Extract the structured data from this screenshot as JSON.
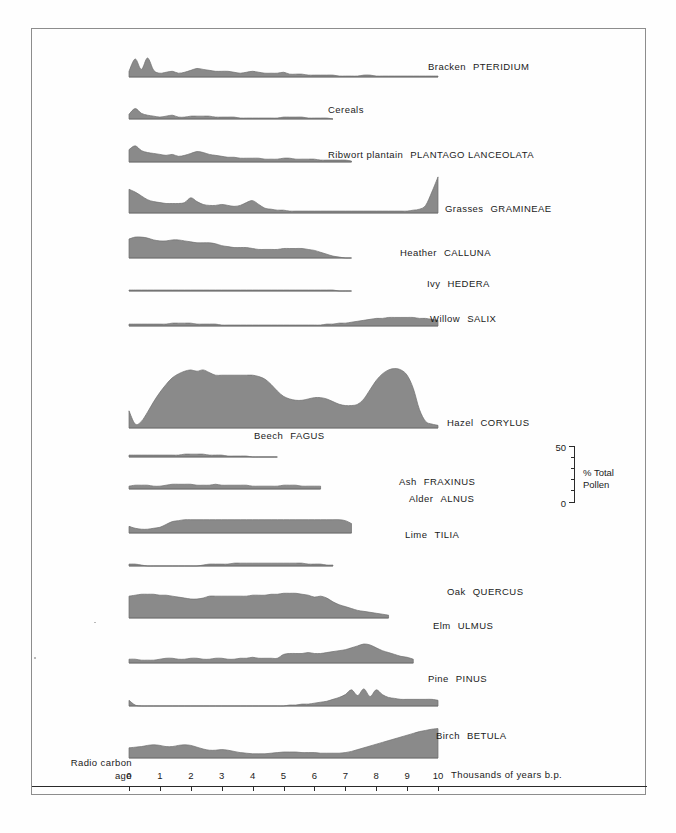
{
  "figure": {
    "type": "pollen-percentage-diagram",
    "fill_color": "#8a8a8a",
    "line_color": "#6f6f6f",
    "axis_color": "#2a2a2a"
  },
  "axis": {
    "left_label_line1": "Radio  carbon",
    "left_label_line2": "age",
    "right_label": "Thousands of years    b.p.",
    "ticks": [
      "0",
      "1",
      "2",
      "3",
      "4",
      "5",
      "6",
      "7",
      "8",
      "9",
      "10"
    ],
    "x_min": 0,
    "x_max": 10
  },
  "scale": {
    "top_value": "50",
    "bottom_value": "0",
    "unit_line1": "% Total",
    "unit_line2": "Pollen",
    "units": "% Total Pollen",
    "range": [
      0,
      50
    ]
  },
  "chart_data": {
    "type": "area",
    "title": "",
    "xlabel": "Thousands of years b.p. (radio carbon age)",
    "ylabel": "% Total Pollen",
    "xlim": [
      0,
      10
    ],
    "ylim": [
      0,
      50
    ],
    "grid": false,
    "legend": "none",
    "note": "Each taxon is an independent area curve plotted against radiocarbon age; x runs 0 (left, present) to 10 (right, 10000 b.p.). Values are % total pollen estimated from the 0-50 scale bar.",
    "x": [
      0,
      0.2,
      0.4,
      0.6,
      0.8,
      1.0,
      1.2,
      1.4,
      1.6,
      1.8,
      2.0,
      2.2,
      2.4,
      2.6,
      2.8,
      3.0,
      3.2,
      3.4,
      3.6,
      3.8,
      4.0,
      4.2,
      4.4,
      4.6,
      4.8,
      5.0,
      5.2,
      5.4,
      5.6,
      5.8,
      6.0,
      6.2,
      6.4,
      6.6,
      6.8,
      7.0,
      7.2,
      7.4,
      7.6,
      7.8,
      8.0,
      8.2,
      8.4,
      8.6,
      8.8,
      9.0,
      9.2,
      9.4,
      9.6,
      9.8,
      10.0
    ],
    "series": [
      {
        "name": "Bracken PTERIDIUM",
        "common": "Bracken",
        "latin": "PTERIDIUM",
        "values": [
          6,
          19,
          8,
          20,
          7,
          4,
          5,
          6,
          4,
          5,
          7,
          9,
          8,
          7,
          6,
          6,
          6,
          5,
          4,
          5,
          6,
          5,
          4,
          4,
          4,
          5,
          3,
          3,
          3,
          2,
          2,
          2,
          2,
          2,
          1,
          1,
          1,
          1,
          2,
          2,
          1,
          1,
          1,
          1,
          1,
          1,
          1,
          1,
          1,
          1,
          1
        ]
      },
      {
        "name": "Cereals",
        "common": "Cereals",
        "latin": "",
        "values": [
          5,
          11,
          6,
          4,
          3,
          2,
          3,
          4,
          2,
          2,
          3,
          3,
          3,
          3,
          2,
          2,
          2,
          2,
          1,
          1,
          1,
          1,
          1,
          1,
          1,
          2,
          2,
          2,
          2,
          1,
          1,
          1,
          1,
          0,
          0,
          0,
          0,
          0,
          0,
          0,
          0,
          0,
          0,
          0,
          0,
          0,
          0,
          0,
          0,
          0,
          0
        ]
      },
      {
        "name": "Ribwort plantain PLANTAGO LANCEOLATA",
        "common": "Ribwort plantain",
        "latin": "PLANTAGO  LANCEOLATA",
        "values": [
          13,
          17,
          12,
          10,
          9,
          8,
          7,
          8,
          6,
          7,
          9,
          11,
          10,
          8,
          7,
          6,
          5,
          5,
          4,
          4,
          4,
          4,
          3,
          3,
          3,
          4,
          4,
          3,
          3,
          3,
          3,
          2,
          2,
          2,
          2,
          2,
          1,
          1,
          1,
          1,
          1,
          1,
          1,
          0,
          0,
          0,
          0,
          0,
          0,
          0,
          0
        ]
      },
      {
        "name": "Grasses GRAMINEAE",
        "common": "Grasses",
        "latin": "GRAMINEAE",
        "values": [
          25,
          22,
          18,
          14,
          12,
          11,
          10,
          10,
          10,
          11,
          16,
          12,
          9,
          8,
          8,
          9,
          8,
          7,
          8,
          11,
          13,
          9,
          5,
          4,
          3,
          3,
          2,
          2,
          2,
          2,
          2,
          2,
          2,
          2,
          2,
          2,
          2,
          2,
          2,
          2,
          2,
          2,
          2,
          2,
          2,
          2,
          3,
          4,
          8,
          22,
          38
        ]
      },
      {
        "name": "Heather CALLUNA",
        "common": "Heather",
        "latin": "CALLUNA",
        "values": [
          20,
          22,
          22,
          21,
          19,
          18,
          18,
          19,
          19,
          18,
          17,
          16,
          16,
          16,
          15,
          13,
          12,
          11,
          11,
          11,
          10,
          9,
          9,
          9,
          9,
          10,
          10,
          10,
          10,
          9,
          8,
          6,
          4,
          2,
          1,
          0,
          0,
          0,
          0,
          0,
          0,
          0,
          0,
          0,
          0,
          0,
          0,
          0,
          0,
          0,
          0
        ]
      },
      {
        "name": "Ivy HEDERA",
        "common": "Ivy",
        "latin": "HEDERA",
        "values": [
          1,
          1,
          1,
          1,
          1,
          1,
          1,
          1,
          1,
          1,
          1,
          1,
          1,
          1,
          1,
          1,
          1,
          1,
          1,
          1,
          1,
          1,
          1,
          1,
          1,
          1,
          1,
          1,
          1,
          1,
          1,
          1,
          1,
          1,
          0,
          0,
          0,
          0,
          0,
          0,
          0,
          0,
          0,
          0,
          0,
          0,
          0,
          0,
          0,
          0,
          0
        ]
      },
      {
        "name": "Willow SALIX",
        "common": "Willow",
        "latin": "SALIX",
        "values": [
          2,
          2,
          2,
          2,
          2,
          2,
          2,
          3,
          3,
          3,
          3,
          2,
          2,
          2,
          2,
          1,
          1,
          1,
          1,
          1,
          1,
          1,
          1,
          1,
          1,
          1,
          1,
          1,
          1,
          1,
          1,
          1,
          2,
          2,
          3,
          3,
          4,
          5,
          6,
          7,
          8,
          8,
          9,
          9,
          9,
          9,
          9,
          8,
          8,
          7,
          6
        ]
      },
      {
        "name": "Hazel CORYLUS",
        "common": "Hazel",
        "latin": "CORYLUS",
        "values": [
          13,
          3,
          5,
          12,
          20,
          27,
          33,
          38,
          41,
          43,
          44,
          43,
          44,
          42,
          40,
          40,
          40,
          40,
          40,
          40,
          40,
          39,
          37,
          33,
          28,
          24,
          22,
          21,
          21,
          22,
          23,
          23,
          22,
          20,
          18,
          17,
          17,
          18,
          22,
          29,
          36,
          41,
          44,
          45,
          44,
          40,
          30,
          14,
          5,
          3,
          2
        ]
      },
      {
        "name": "Beech FAGUS",
        "common": "Beech",
        "latin": "FAGUS",
        "values": [
          2,
          2,
          2,
          2,
          2,
          2,
          2,
          2,
          2,
          3,
          3,
          3,
          3,
          2,
          2,
          2,
          1,
          1,
          1,
          1,
          0,
          0,
          0,
          0,
          0,
          0,
          0,
          0,
          0,
          0,
          0,
          0,
          0,
          0,
          0,
          0,
          0,
          0,
          0,
          0,
          0,
          0,
          0,
          0,
          0,
          0,
          0,
          0,
          0,
          0,
          0
        ]
      },
      {
        "name": "Ash FRAXINUS",
        "common": "Ash",
        "latin": "FRAXINUS",
        "values": [
          3,
          4,
          4,
          4,
          3,
          3,
          4,
          5,
          5,
          5,
          5,
          4,
          4,
          4,
          5,
          4,
          4,
          4,
          4,
          4,
          3,
          3,
          3,
          3,
          3,
          4,
          4,
          4,
          3,
          3,
          3,
          3,
          3,
          3,
          2,
          2,
          2,
          2,
          1,
          1,
          1,
          0,
          0,
          0,
          0,
          0,
          0,
          0,
          0,
          0,
          0
        ]
      },
      {
        "name": "Alder ALNUS",
        "common": "Alder",
        "latin": "ALNUS",
        "values": [
          7,
          5,
          4,
          4,
          5,
          6,
          9,
          12,
          13,
          14,
          14,
          14,
          14,
          14,
          14,
          14,
          14,
          14,
          14,
          14,
          14,
          14,
          14,
          14,
          14,
          14,
          14,
          14,
          14,
          14,
          14,
          14,
          14,
          14,
          14,
          13,
          10,
          5,
          3,
          2,
          2,
          1,
          1,
          1,
          0,
          0,
          0,
          0,
          0,
          0,
          0
        ]
      },
      {
        "name": "Lime TILIA",
        "common": "Lime",
        "latin": "TILIA",
        "values": [
          2,
          2,
          1,
          0,
          0,
          0,
          0,
          0,
          0,
          0,
          0,
          0,
          1,
          2,
          2,
          2,
          2,
          3,
          3,
          3,
          3,
          3,
          3,
          3,
          3,
          3,
          3,
          3,
          3,
          2,
          2,
          2,
          1,
          1,
          0,
          0,
          0,
          0,
          0,
          0,
          0,
          0,
          0,
          0,
          0,
          0,
          0,
          0,
          0,
          0,
          0
        ]
      },
      {
        "name": "Oak QUERCUS",
        "common": "Oak",
        "latin": "QUERCUS",
        "values": [
          23,
          24,
          25,
          25,
          25,
          24,
          24,
          23,
          22,
          21,
          20,
          20,
          21,
          23,
          23,
          23,
          23,
          23,
          23,
          23,
          24,
          24,
          24,
          25,
          25,
          26,
          26,
          26,
          25,
          24,
          22,
          23,
          21,
          17,
          14,
          12,
          10,
          8,
          7,
          6,
          5,
          4,
          3,
          3,
          2,
          2,
          2,
          1,
          1,
          1,
          1
        ]
      },
      {
        "name": "Elm ULMUS",
        "common": "Elm",
        "latin": "ULMUS",
        "values": [
          4,
          4,
          3,
          3,
          3,
          4,
          5,
          5,
          4,
          4,
          5,
          5,
          4,
          4,
          5,
          5,
          4,
          4,
          5,
          5,
          6,
          5,
          5,
          5,
          5,
          9,
          10,
          10,
          10,
          11,
          10,
          10,
          11,
          12,
          13,
          14,
          16,
          18,
          20,
          19,
          16,
          13,
          11,
          9,
          7,
          6,
          4,
          3,
          2,
          1,
          1
        ]
      },
      {
        "name": "Pine PINUS",
        "common": "Pine",
        "latin": "PINUS",
        "values": [
          6,
          1,
          0,
          0,
          0,
          0,
          0,
          0,
          0,
          0,
          0,
          0,
          0,
          0,
          0,
          0,
          0,
          0,
          0,
          0,
          0,
          0,
          0,
          0,
          0,
          0,
          1,
          1,
          2,
          2,
          3,
          4,
          5,
          7,
          9,
          12,
          17,
          11,
          18,
          10,
          17,
          12,
          9,
          8,
          7,
          7,
          7,
          7,
          7,
          7,
          6
        ]
      },
      {
        "name": "Birch BETULA",
        "common": "Birch",
        "latin": "BETULA",
        "values": [
          17,
          18,
          19,
          21,
          22,
          21,
          19,
          19,
          21,
          22,
          21,
          18,
          15,
          13,
          13,
          14,
          13,
          11,
          9,
          8,
          7,
          7,
          7,
          8,
          9,
          10,
          10,
          10,
          9,
          9,
          9,
          8,
          8,
          8,
          8,
          9,
          11,
          14,
          17,
          20,
          23,
          26,
          29,
          32,
          35,
          38,
          41,
          44,
          46,
          48,
          49
        ]
      }
    ]
  },
  "taxa_rows": [
    {
      "label_common": "Bracken",
      "label_latin": "PTERIDIUM"
    },
    {
      "label_common": "Cereals",
      "label_latin": ""
    },
    {
      "label_common": "Ribwort plantain",
      "label_latin": "PLANTAGO  LANCEOLATA"
    },
    {
      "label_common": "Grasses",
      "label_latin": "GRAMINEAE"
    },
    {
      "label_common": "Heather",
      "label_latin": "CALLUNA"
    },
    {
      "label_common": "Ivy",
      "label_latin": "HEDERA"
    },
    {
      "label_common": "Willow",
      "label_latin": "SALIX"
    },
    {
      "label_common": "Hazel",
      "label_latin": "CORYLUS"
    },
    {
      "label_common": "Beech",
      "label_latin": "FAGUS"
    },
    {
      "label_common": "Ash",
      "label_latin": "FRAXINUS"
    },
    {
      "label_common": "Alder",
      "label_latin": "ALNUS"
    },
    {
      "label_common": "Lime",
      "label_latin": "TILIA"
    },
    {
      "label_common": "Oak",
      "label_latin": "QUERCUS"
    },
    {
      "label_common": "Elm",
      "label_latin": "ULMUS"
    },
    {
      "label_common": "Pine",
      "label_latin": "PINUS"
    },
    {
      "label_common": "Birch",
      "label_latin": "BETULA"
    }
  ]
}
